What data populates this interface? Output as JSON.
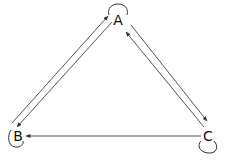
{
  "diagram": {
    "type": "directed-graph",
    "nodes": [
      {
        "id": "A",
        "label": "A",
        "x": 118,
        "y": 20,
        "self_loop": "top"
      },
      {
        "id": "B",
        "label": "B",
        "x": 17,
        "y": 134,
        "self_loop": "bottom-left"
      },
      {
        "id": "C",
        "label": "C",
        "x": 208,
        "y": 134,
        "self_loop": "bottom"
      }
    ],
    "edges": [
      {
        "from": "B",
        "to": "A"
      },
      {
        "from": "A",
        "to": "B"
      },
      {
        "from": "A",
        "to": "C"
      },
      {
        "from": "C",
        "to": "A"
      },
      {
        "from": "C",
        "to": "B"
      },
      {
        "from": "A",
        "to": "A"
      },
      {
        "from": "B",
        "to": "B"
      },
      {
        "from": "C",
        "to": "C"
      }
    ],
    "colors": {
      "edge": "#555555",
      "label": "#111111",
      "background": "#ffffff"
    }
  }
}
